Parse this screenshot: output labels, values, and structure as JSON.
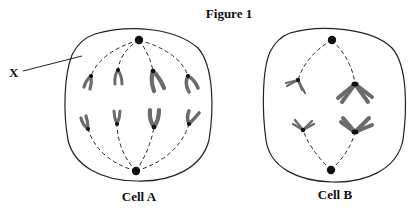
{
  "figure": {
    "title": "Figure 1",
    "pointer_label": "X",
    "cells": [
      {
        "id": "A",
        "label": "Cell A",
        "stage_depicted": "chromosomes aligned as pairs on spindle, 8 chromosomes visible"
      },
      {
        "id": "B",
        "label": "Cell B",
        "stage_depicted": "4 X-shaped chromosomes attached to spindle"
      }
    ]
  },
  "colors": {
    "outline": "#222222",
    "chromosome": "#6b6b6b",
    "pole": "#111111",
    "background": "#ffffff"
  }
}
